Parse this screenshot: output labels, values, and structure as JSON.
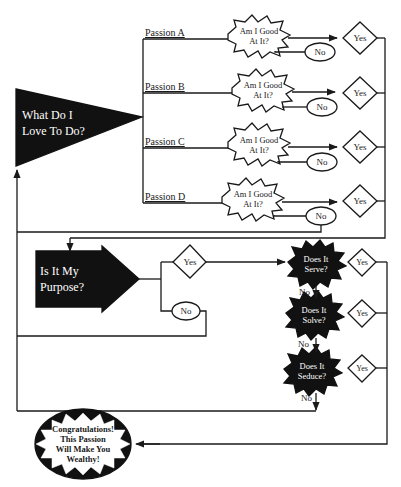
{
  "main_question": "What Do I Love To Do?",
  "main_question_lines": [
    "What Do I",
    "Love To Do?"
  ],
  "passions": [
    {
      "label": "Passion A",
      "check": "Am I Good At It?",
      "check_lines": [
        "Am I Good",
        "At It?"
      ],
      "yes": "Yes",
      "no": "No"
    },
    {
      "label": "Passion B",
      "check": "Am I Good At It?",
      "check_lines": [
        "Am I Good",
        "At It?"
      ],
      "yes": "Yes",
      "no": "No"
    },
    {
      "label": "Passion C",
      "check": "Am I Good At It?",
      "check_lines": [
        "Am I Good",
        "At It?"
      ],
      "yes": "Yes",
      "no": "No"
    },
    {
      "label": "Passion D",
      "check": "Am I Good At It?",
      "check_lines": [
        "Am I Good",
        "At It?"
      ],
      "yes": "Yes",
      "no": "No"
    }
  ],
  "purpose": {
    "question_lines": [
      "Is It My",
      "Purpose?"
    ],
    "yes": "Yes",
    "no": "No"
  },
  "tests": [
    {
      "lines": [
        "Does It",
        "Serve?"
      ],
      "yes": "Yes",
      "no": "No"
    },
    {
      "lines": [
        "Does It",
        "Solve?"
      ],
      "yes": "Yes",
      "no": "No"
    },
    {
      "lines": [
        "Does It",
        "Seduce?"
      ],
      "yes": "Yes",
      "no": "No"
    }
  ],
  "result_lines": [
    "Congratulations!",
    "This Passion",
    "Will Make You",
    "Wealthy!"
  ],
  "colors": {
    "ink": "#1a1a1a",
    "paper": "#ffffff"
  }
}
